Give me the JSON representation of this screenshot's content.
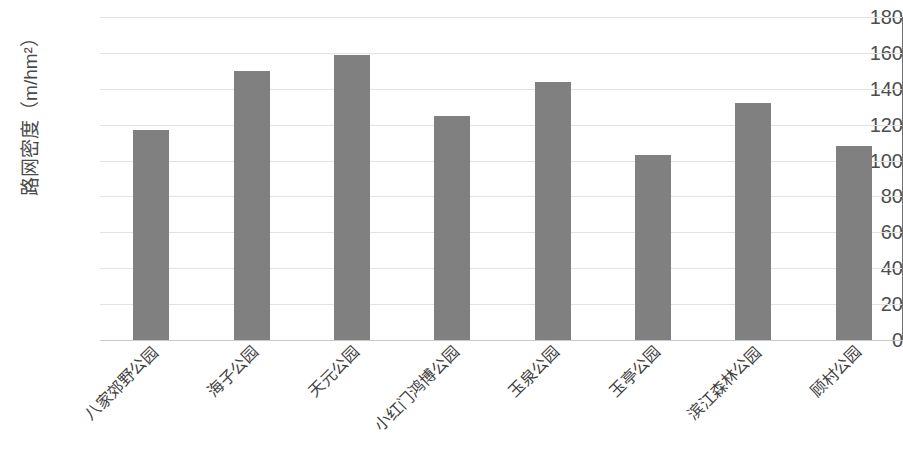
{
  "chart_data": {
    "type": "bar",
    "title": "",
    "xlabel": "",
    "ylabel": "路网密度（m/hm²）",
    "ylim": [
      0,
      180
    ],
    "ytick_labels": [
      "180",
      "160",
      "140",
      "120",
      "100",
      "80",
      "60",
      "40",
      "20",
      "0"
    ],
    "ytick_values": [
      180,
      160,
      140,
      120,
      100,
      80,
      60,
      40,
      20,
      0
    ],
    "grid": true,
    "legend": "none",
    "bar_color": "#808080",
    "categories": [
      "八家郊野公园",
      "海子公园",
      "天元公园",
      "小红门鸿博公园",
      "玉泉公园",
      "玉亭公园",
      "滨江森林公园",
      "顾村公园"
    ],
    "values": [
      117,
      150,
      159,
      125,
      144,
      103,
      132,
      108
    ]
  }
}
